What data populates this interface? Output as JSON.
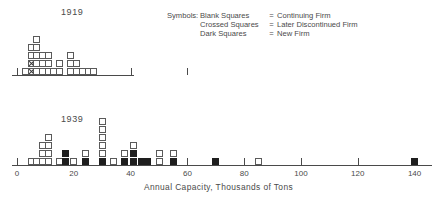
{
  "legend": {
    "title": "Symbols:",
    "equals": "=",
    "rows": [
      {
        "symbol": "Blank Squares",
        "definition": "Continuing Firm"
      },
      {
        "symbol": "Crossed Squares",
        "definition": "Later Discontinued Firm"
      },
      {
        "symbol": "Dark Squares",
        "definition": "New Firm"
      }
    ]
  },
  "axis_title": "Annual Capacity, Thousands of Tons",
  "colors": {
    "ink": "#4a4a4a",
    "dark_square": "#1e1e1e",
    "blank_square_fill": "#ffffff",
    "background": "#ffffff"
  },
  "panels": {
    "p1919": {
      "label": "1919"
    },
    "p1939": {
      "label": "1939"
    }
  },
  "chart_data": [
    {
      "type": "scatter",
      "title": "1919",
      "xlabel": "Annual Capacity, Thousands of Tons",
      "ylabel": "",
      "xlim": [
        0,
        140
      ],
      "ylim": [
        0,
        6
      ],
      "grid": false,
      "legend_position": "top-right",
      "notes": "Stacked-square (dot) histogram. Each square = one firm. Axis unlabeled on this panel; ticks only at 0, 20, 40, 60.",
      "tick_values": [
        0,
        20,
        40,
        60
      ],
      "tick_labels": [
        "",
        "",
        "",
        ""
      ],
      "series": [
        {
          "name": "Continuing Firm",
          "symbol": "blank"
        },
        {
          "name": "Later Discontinued Firm",
          "symbol": "crossed"
        },
        {
          "name": "New Firm",
          "symbol": "dark"
        }
      ],
      "columns": [
        {
          "x": 3,
          "stack": [
            "blank"
          ]
        },
        {
          "x": 5,
          "stack": [
            "crossed",
            "crossed",
            "blank",
            "blank"
          ]
        },
        {
          "x": 7,
          "stack": [
            "blank",
            "blank",
            "blank",
            "blank",
            "blank"
          ]
        },
        {
          "x": 9,
          "stack": [
            "blank",
            "blank",
            "blank"
          ]
        },
        {
          "x": 11,
          "stack": [
            "blank",
            "blank",
            "blank"
          ]
        },
        {
          "x": 13,
          "stack": [
            "blank"
          ]
        },
        {
          "x": 15,
          "stack": [
            "blank",
            "blank"
          ]
        },
        {
          "x": 19,
          "stack": [
            "blank",
            "blank",
            "blank"
          ]
        },
        {
          "x": 21,
          "stack": [
            "blank",
            "blank"
          ]
        },
        {
          "x": 23,
          "stack": [
            "blank"
          ]
        },
        {
          "x": 25,
          "stack": [
            "blank"
          ]
        },
        {
          "x": 27,
          "stack": [
            "blank"
          ]
        }
      ]
    },
    {
      "type": "scatter",
      "title": "1939",
      "xlabel": "Annual Capacity, Thousands of Tons",
      "ylabel": "",
      "xlim": [
        0,
        145
      ],
      "ylim": [
        0,
        6
      ],
      "grid": false,
      "legend_position": "top-right",
      "notes": "Stacked-square (dot) histogram. Each square = one firm.",
      "tick_values": [
        0,
        20,
        40,
        60,
        80,
        100,
        120,
        140
      ],
      "tick_labels": [
        "0",
        "20",
        "40",
        "60",
        "80",
        "100",
        "120",
        "140"
      ],
      "series": [
        {
          "name": "Continuing Firm",
          "symbol": "blank"
        },
        {
          "name": "Later Discontinued Firm",
          "symbol": "crossed"
        },
        {
          "name": "New Firm",
          "symbol": "dark"
        }
      ],
      "columns": [
        {
          "x": 5,
          "stack": [
            "blank"
          ]
        },
        {
          "x": 7,
          "stack": [
            "blank"
          ]
        },
        {
          "x": 9,
          "stack": [
            "blank",
            "blank",
            "blank"
          ]
        },
        {
          "x": 11,
          "stack": [
            "blank",
            "blank",
            "blank",
            "blank"
          ]
        },
        {
          "x": 15,
          "stack": [
            "blank"
          ]
        },
        {
          "x": 17,
          "stack": [
            "dark",
            "dark"
          ]
        },
        {
          "x": 20,
          "stack": [
            "blank"
          ]
        },
        {
          "x": 24,
          "stack": [
            "dark",
            "blank"
          ]
        },
        {
          "x": 30,
          "stack": [
            "dark",
            "blank",
            "blank",
            "blank",
            "blank",
            "blank"
          ]
        },
        {
          "x": 34,
          "stack": [
            "blank"
          ]
        },
        {
          "x": 38,
          "stack": [
            "dark",
            "blank"
          ]
        },
        {
          "x": 41,
          "stack": [
            "dark",
            "dark",
            "blank"
          ]
        },
        {
          "x": 44,
          "stack": [
            "dark"
          ]
        },
        {
          "x": 46,
          "stack": [
            "dark"
          ]
        },
        {
          "x": 50,
          "stack": [
            "blank",
            "blank"
          ]
        },
        {
          "x": 55,
          "stack": [
            "dark",
            "blank"
          ]
        },
        {
          "x": 70,
          "stack": [
            "dark"
          ]
        },
        {
          "x": 85,
          "stack": [
            "blank"
          ]
        },
        {
          "x": 140,
          "stack": [
            "dark"
          ]
        }
      ]
    }
  ]
}
